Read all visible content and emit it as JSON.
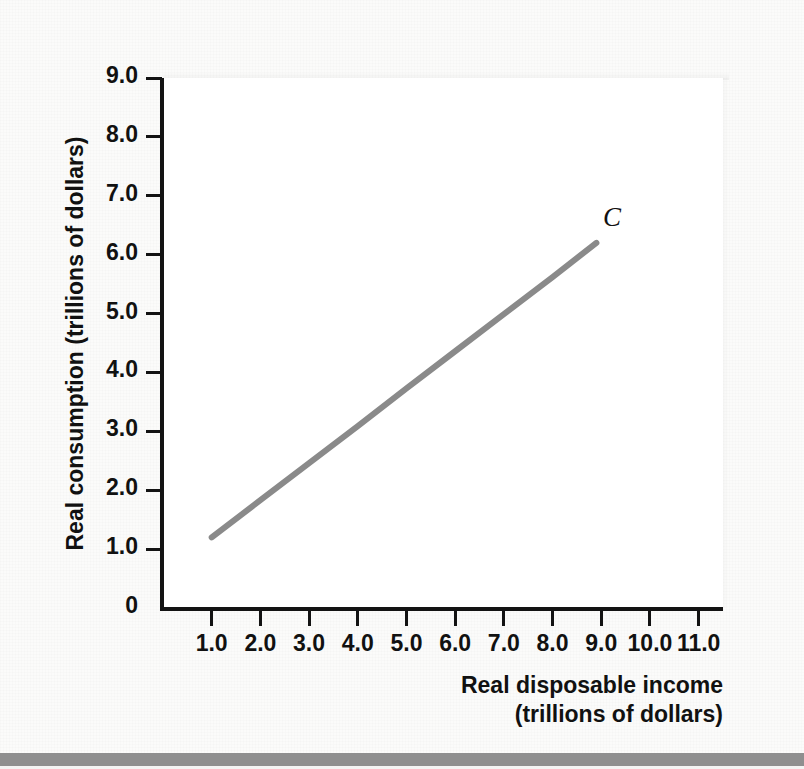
{
  "chart_data": {
    "type": "line",
    "title": "",
    "xlabel": "Real disposable income (trillions of dollars)",
    "ylabel": "Real consumption (trillions of dollars)",
    "xlabel_line1": "Real disposable income",
    "xlabel_line2": "(trillions of dollars)",
    "xlim": [
      0,
      11.5
    ],
    "ylim": [
      0,
      9.0
    ],
    "grid": false,
    "legend_position": "inline-label",
    "x_ticks": [
      1.0,
      2.0,
      3.0,
      4.0,
      5.0,
      6.0,
      7.0,
      8.0,
      9.0,
      10.0,
      11.0
    ],
    "x_tick_labels": [
      "1.0",
      "2.0",
      "3.0",
      "4.0",
      "5.0",
      "6.0",
      "7.0",
      "8.0",
      "9.0",
      "10.0",
      "11.0"
    ],
    "y_ticks": [
      0,
      1.0,
      2.0,
      3.0,
      4.0,
      5.0,
      6.0,
      7.0,
      8.0,
      9.0
    ],
    "y_tick_labels": [
      "0",
      "1.0",
      "2.0",
      "3.0",
      "4.0",
      "5.0",
      "6.0",
      "7.0",
      "8.0",
      "9.0"
    ],
    "series": [
      {
        "name": "C",
        "label": "C",
        "color": "#8a8a8a",
        "line_width": 6,
        "x": [
          1.0,
          2.0,
          3.0,
          4.0,
          5.0,
          6.0,
          7.0,
          8.0,
          8.9
        ],
        "values": [
          1.2,
          1.83,
          2.46,
          3.09,
          3.73,
          4.36,
          4.99,
          5.62,
          6.2
        ],
        "endpoints": {
          "start": {
            "x": 1.0,
            "y": 1.2
          },
          "end": {
            "x": 8.9,
            "y": 6.2
          }
        },
        "slope": 0.633,
        "intercept": 0.567
      }
    ],
    "annotations": [
      {
        "text": "C",
        "x": 9.2,
        "y": 6.55,
        "style": "italic"
      }
    ]
  },
  "colors": {
    "background": "#fbfbfa",
    "plot_background": "#ffffff",
    "axis": "#131313",
    "series_line": "#8a8a8a",
    "text": "#111111",
    "footer_bar": "#8f8f8f"
  }
}
